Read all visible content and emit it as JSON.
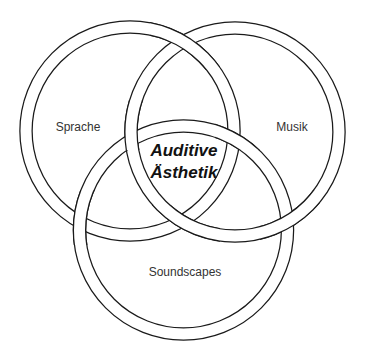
{
  "diagram": {
    "type": "venn",
    "style": "interlocking-rings",
    "ring_color": "#1a1a1a",
    "background": "#ffffff",
    "sets": [
      {
        "id": "sprache",
        "label": "Sprache",
        "cx": 130,
        "cy": 131,
        "r": 104
      },
      {
        "id": "musik",
        "label": "Musik",
        "cx": 235,
        "cy": 132,
        "r": 104
      },
      {
        "id": "soundscapes",
        "label": "Soundscapes",
        "cx": 183.5,
        "cy": 230,
        "r": 104
      }
    ],
    "intersection": {
      "line1": "Auditive",
      "line2": "Ästhetik"
    }
  }
}
